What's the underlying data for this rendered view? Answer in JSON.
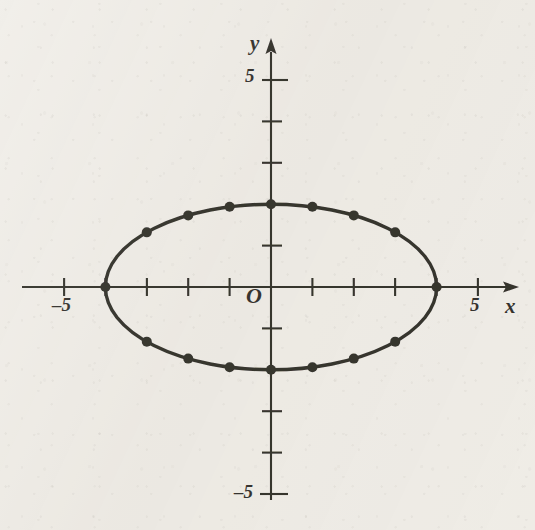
{
  "figure": {
    "kind": "cartesian-plane-with-ellipse",
    "background_color": "#eeebe5",
    "ink_color": "#15130f"
  },
  "axes": {
    "x_axis_label": "x",
    "y_axis_label": "y",
    "origin_label": "O",
    "x_tick_labels": [
      {
        "text": "–5",
        "value": -5
      },
      {
        "text": "5",
        "value": 5
      }
    ],
    "y_tick_labels": [
      {
        "text": "5",
        "value": 5
      },
      {
        "text": "–5",
        "value": -5
      }
    ],
    "x_ticks": [
      -5,
      -4,
      -3,
      -2,
      -1,
      1,
      2,
      3,
      4,
      5
    ],
    "y_ticks": [
      5,
      4,
      3,
      2,
      1,
      -1,
      -2,
      -3,
      -4,
      -5
    ],
    "x_arrow": "right-arrowhead",
    "y_arrow": "up-arrowhead"
  },
  "chart_data": {
    "type": "scatter",
    "title": "",
    "subtitle": "",
    "xlabel": "x",
    "ylabel": "y",
    "xlim": [
      -5.8,
      5.8
    ],
    "ylim": [
      -5.5,
      5.5
    ],
    "grid": false,
    "legend": null,
    "curve": {
      "name": "ellipse",
      "equation": "x^2/16 + y^2/4 = 1",
      "center": [
        0,
        0
      ],
      "semi_major_axis_a": 4,
      "semi_minor_axis_b": 2,
      "orientation": "horizontal",
      "stroke_width_px": 3.2
    },
    "marked_points": [
      {
        "x": -4,
        "y": 0
      },
      {
        "x": -3,
        "y": 1.32
      },
      {
        "x": -2,
        "y": 1.73
      },
      {
        "x": -1,
        "y": 1.94
      },
      {
        "x": 0,
        "y": 2
      },
      {
        "x": 1,
        "y": 1.94
      },
      {
        "x": 2,
        "y": 1.73
      },
      {
        "x": 3,
        "y": 1.32
      },
      {
        "x": 4,
        "y": 0
      },
      {
        "x": 3,
        "y": -1.32
      },
      {
        "x": 2,
        "y": -1.73
      },
      {
        "x": 1,
        "y": -1.94
      },
      {
        "x": 0,
        "y": -2
      },
      {
        "x": -1,
        "y": -1.94
      },
      {
        "x": -2,
        "y": -1.73
      },
      {
        "x": -3,
        "y": -1.32
      }
    ],
    "marker": {
      "shape": "filled-circle",
      "radius_px": 5,
      "color": "#15130f"
    }
  },
  "geometry": {
    "origin_px": [
      271,
      287
    ],
    "unit_px": 41.4,
    "x_axis_y_px": 287,
    "y_axis_x_px": 271
  }
}
